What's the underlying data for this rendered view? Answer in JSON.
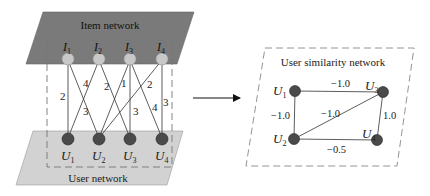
{
  "bipartite": {
    "item_network_label": "Item network",
    "user_network_label": "User network",
    "items": [
      {
        "id": "I1",
        "letter": "I",
        "sub": "1"
      },
      {
        "id": "I2",
        "letter": "I",
        "sub": "2"
      },
      {
        "id": "I3",
        "letter": "I",
        "sub": "3"
      },
      {
        "id": "I4",
        "letter": "I",
        "sub": "4"
      }
    ],
    "users": [
      {
        "id": "U1",
        "letter": "U",
        "sub": "1"
      },
      {
        "id": "U2",
        "letter": "U",
        "sub": "2"
      },
      {
        "id": "U3",
        "letter": "U",
        "sub": "3"
      },
      {
        "id": "U4",
        "letter": "U",
        "sub": "4"
      }
    ],
    "edges": [
      {
        "item": "I1",
        "user": "U1",
        "weight": "2"
      },
      {
        "item": "I1",
        "user": "U2",
        "weight": "3"
      },
      {
        "item": "I2",
        "user": "U1",
        "weight": "4"
      },
      {
        "item": "I2",
        "user": "U3",
        "weight": "2"
      },
      {
        "item": "I3",
        "user": "U2",
        "weight": "1"
      },
      {
        "item": "I3",
        "user": "U3",
        "weight": "3"
      },
      {
        "item": "I3",
        "user": "U4",
        "weight": "4"
      },
      {
        "item": "I4",
        "user": "U2",
        "weight": "2"
      },
      {
        "item": "I4",
        "user": "U4",
        "weight": "3"
      }
    ]
  },
  "similarity": {
    "title": "User similarity network",
    "nodes": [
      {
        "id": "U1",
        "letter": "U",
        "sub": "1"
      },
      {
        "id": "U2",
        "letter": "U",
        "sub": "2"
      },
      {
        "id": "U3",
        "letter": "U",
        "sub": "3"
      },
      {
        "id": "U4",
        "letter": "U",
        "sub": "4"
      }
    ],
    "edges": [
      {
        "from": "U1",
        "to": "U3",
        "weight": "−1.0"
      },
      {
        "from": "U1",
        "to": "U2",
        "weight": "−1.0"
      },
      {
        "from": "U2",
        "to": "U3",
        "weight": "−1.0"
      },
      {
        "from": "U3",
        "to": "U4",
        "weight": "1.0"
      },
      {
        "from": "U2",
        "to": "U4",
        "weight": "−0.5"
      }
    ]
  },
  "colors": {
    "item_plane": "#7a7a7a",
    "user_plane": "#d2d2d2",
    "item_node": "#c8c8c8",
    "user_node": "#4a4a4a",
    "edge": "#333333",
    "dashed": "#777777"
  }
}
